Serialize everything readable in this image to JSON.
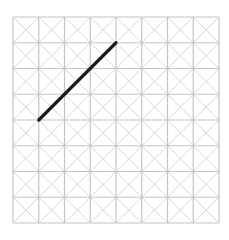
{
  "diagram": {
    "type": "grid-with-line",
    "grid": {
      "columns": 8,
      "rows": 8,
      "origin_px": [
        13,
        17
      ],
      "cell_size_px": 25.75,
      "cell_diagonals": true,
      "grid_color": "#c4c4c4",
      "diagonal_color": "#d6d6d6"
    },
    "segments": [
      {
        "from_grid": [
          1,
          4
        ],
        "to_grid": [
          4,
          1
        ],
        "color": "#1c1c1c",
        "width": 3.2
      }
    ]
  }
}
